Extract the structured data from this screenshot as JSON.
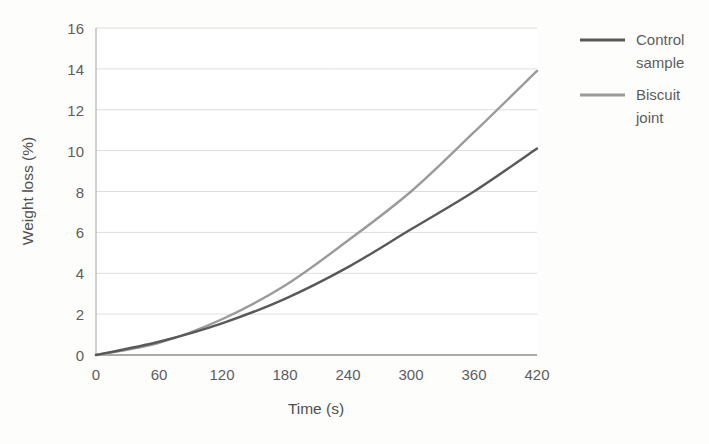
{
  "chart_data": {
    "type": "line",
    "title": "",
    "xlabel": "Time (s)",
    "ylabel": "Weight loss (%)",
    "xlim": [
      0,
      420
    ],
    "ylim": [
      0,
      16
    ],
    "xticks": [
      "0",
      "60",
      "120",
      "180",
      "240",
      "300",
      "360",
      "420"
    ],
    "yticks": [
      "0",
      "2",
      "4",
      "6",
      "8",
      "10",
      "12",
      "14",
      "16"
    ],
    "grid": "horizontal",
    "legend_position": "right",
    "x": [
      0,
      60,
      120,
      180,
      240,
      300,
      360,
      420
    ],
    "series": [
      {
        "name": "Control sample",
        "color": "#595959",
        "values": [
          0.0,
          0.65,
          1.55,
          2.75,
          4.3,
          6.15,
          8.0,
          10.1
        ]
      },
      {
        "name": "Biscuit joint",
        "color": "#9b9b9b",
        "values": [
          0.0,
          0.6,
          1.75,
          3.4,
          5.6,
          8.0,
          10.9,
          13.9
        ]
      }
    ]
  },
  "axes": {
    "y_label": "Weight loss (%)",
    "x_label": "Time (s)"
  },
  "legend": {
    "entries": [
      {
        "label_line1": "Control",
        "label_line2": "sample",
        "color": "#595959"
      },
      {
        "label_line1": "Biscuit",
        "label_line2": "joint",
        "color": "#9b9b9b"
      }
    ]
  }
}
